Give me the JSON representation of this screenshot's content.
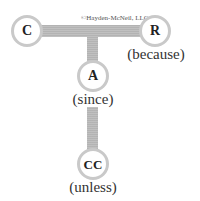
{
  "diagram": {
    "copyright": "©Hayden-McNeil, LLC",
    "colors": {
      "connector": "#b9b9b9",
      "node_border": "#c9c9c9",
      "node_fill": "#ffffff",
      "text": "#333333"
    },
    "nodes": [
      {
        "id": "C",
        "letter": "C",
        "caption": ""
      },
      {
        "id": "R",
        "letter": "R",
        "caption": "(because)"
      },
      {
        "id": "A",
        "letter": "A",
        "caption": "(since)"
      },
      {
        "id": "CC",
        "letter": "CC",
        "caption": "(unless)"
      }
    ],
    "edges": [
      {
        "from": "C",
        "to": "R",
        "style": "horizontal-bar"
      },
      {
        "from": "C-R bar",
        "to": "A",
        "style": "vertical-bar"
      },
      {
        "from": "A",
        "to": "CC",
        "style": "vertical-bar"
      }
    ]
  }
}
